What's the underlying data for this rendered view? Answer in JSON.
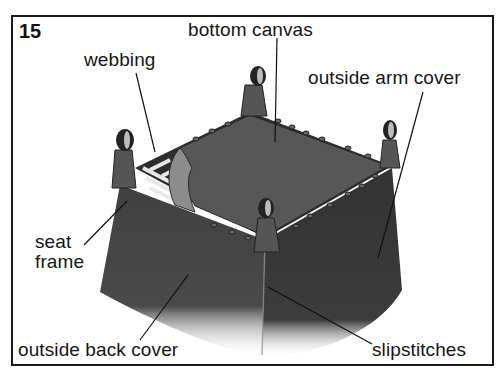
{
  "figure": {
    "number": "15"
  },
  "labels": {
    "bottom_canvas": "bottom canvas",
    "webbing": "webbing",
    "outside_arm_cover": "outside arm cover",
    "seat": "seat",
    "frame": "frame",
    "outside_back_cover": "outside back cover",
    "slipstitches": "slipstitches"
  },
  "colors": {
    "border": "#1a1a1a",
    "fabric_dark": "#3a3a3a",
    "fabric_mid": "#4d4d4d",
    "canvas": "#5a5a5a",
    "text": "#151515"
  }
}
